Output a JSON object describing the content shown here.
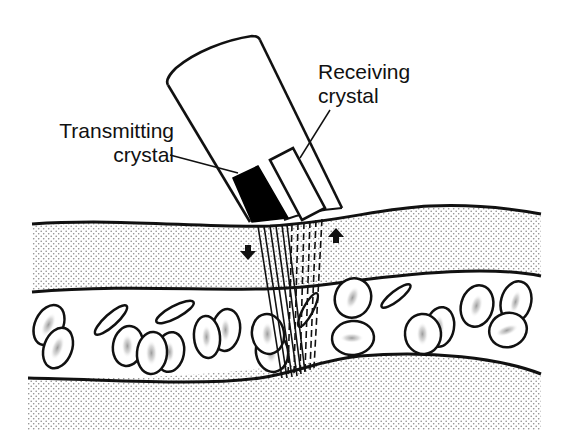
{
  "diagram": {
    "labels": {
      "transmitting": {
        "line1": "Transmitting",
        "line2": "crystal"
      },
      "receiving": {
        "line1": "Receiving",
        "line2": "crystal"
      }
    },
    "components": [
      {
        "id": "probe",
        "name": "Ultrasound probe housing"
      },
      {
        "id": "transmitting-crystal",
        "name": "Transmitting crystal",
        "fill": "#000000"
      },
      {
        "id": "receiving-crystal",
        "name": "Receiving crystal",
        "fill": "#ffffff"
      },
      {
        "id": "upper-tissue-layer",
        "name": "Tissue / vessel wall (upper)",
        "pattern": "stipple"
      },
      {
        "id": "blood-lumen",
        "name": "Vessel lumen with red blood cells"
      },
      {
        "id": "lower-tissue-layer",
        "name": "Tissue / vessel wall (lower)",
        "pattern": "stipple"
      },
      {
        "id": "transmitted-beam",
        "name": "Transmitted ultrasound beam",
        "style": "solid lines"
      },
      {
        "id": "reflected-beam",
        "name": "Reflected ultrasound beam",
        "style": "dashed lines"
      },
      {
        "id": "arrow-down",
        "name": "Transmit direction arrow"
      },
      {
        "id": "arrow-up",
        "name": "Receive direction arrow"
      }
    ],
    "colors": {
      "ink": "#111111",
      "background": "#ffffff",
      "stipple": "#8a8a8a",
      "cell_shading": "#777777"
    }
  }
}
